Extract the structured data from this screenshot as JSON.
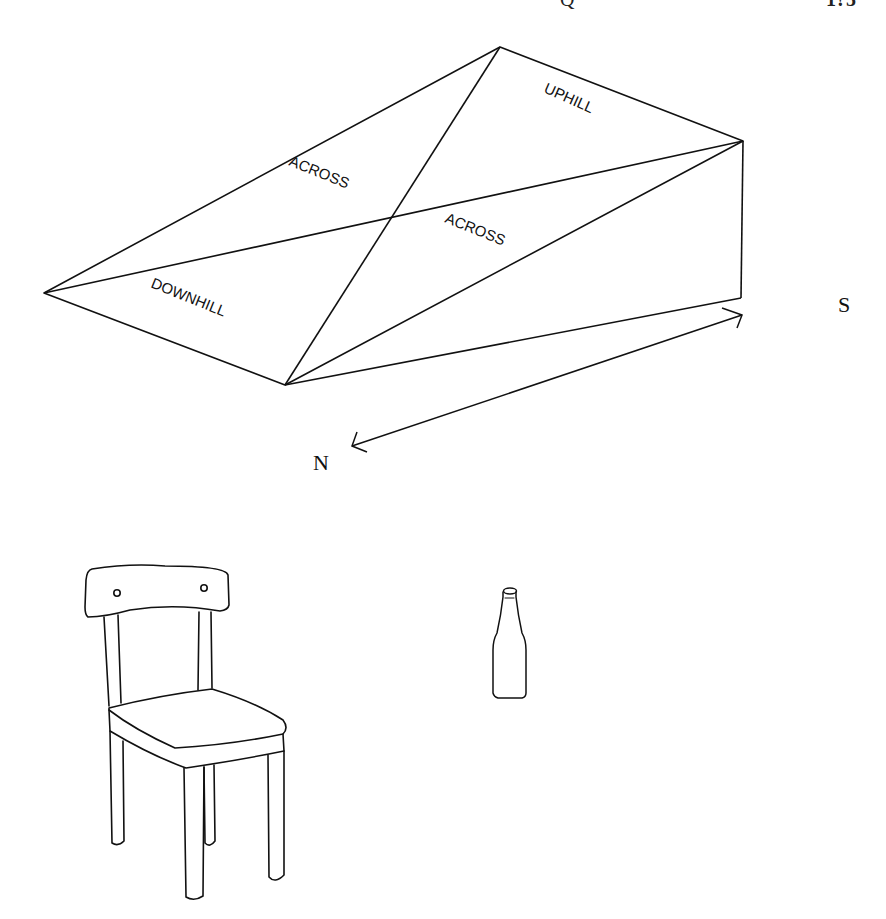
{
  "header": {
    "running_title_fragment": "Q",
    "page_number_fragment": "1?5"
  },
  "ramp_diagram": {
    "labels": {
      "uphill": "UPHILL",
      "across_top": "ACROSS",
      "across_bottom": "ACROSS",
      "downhill": "DOWNHILL"
    },
    "compass": {
      "north": "N",
      "south": "S"
    },
    "vertices": {
      "apex_top": [
        500,
        47
      ],
      "right_top": [
        743,
        141
      ],
      "left_point": [
        44,
        293
      ],
      "front_bottom": [
        285,
        385
      ],
      "right_bottom": [
        741,
        298
      ]
    }
  },
  "objects": {
    "chair": "chair",
    "bottle": "bottle"
  },
  "colors": {
    "ink": "#111111",
    "background": "#ffffff"
  }
}
